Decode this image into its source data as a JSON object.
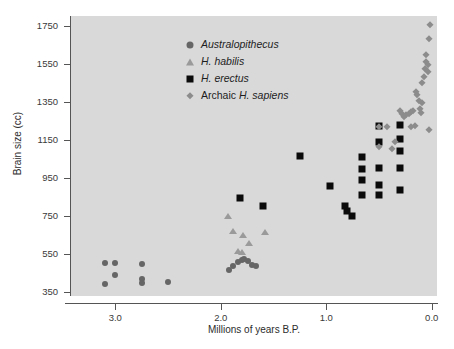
{
  "chart_data": {
    "type": "scatter",
    "title": "",
    "xlabel": "Millions of years B.P.",
    "ylabel": "Brain size (cc)",
    "xlim": [
      3.42,
      -0.05
    ],
    "ylim": [
      330,
      1800
    ],
    "x_reversed": true,
    "grid": false,
    "legend_position": "upper-left-inside",
    "xticks": [
      "3.0",
      "2.0",
      "1.0",
      "0.0"
    ],
    "xtick_values": [
      3.0,
      2.0,
      1.0,
      0.0
    ],
    "yticks": [
      "350",
      "550",
      "750",
      "950",
      "1150",
      "1350",
      "1550",
      "1750"
    ],
    "ytick_values": [
      350,
      550,
      750,
      950,
      1150,
      1350,
      1550,
      1750
    ],
    "plot_background": "#d9d9d9",
    "series": [
      {
        "name": "Australopithecus",
        "italic": true,
        "marker": "circle",
        "color": "#666666",
        "size": 6,
        "points": [
          [
            3.1,
            505
          ],
          [
            3.0,
            505
          ],
          [
            3.1,
            395
          ],
          [
            3.0,
            440
          ],
          [
            2.75,
            500
          ],
          [
            2.75,
            420
          ],
          [
            2.75,
            400
          ],
          [
            2.5,
            405
          ],
          [
            1.92,
            465
          ],
          [
            1.88,
            490
          ],
          [
            1.84,
            510
          ],
          [
            1.8,
            520
          ],
          [
            1.78,
            522
          ],
          [
            1.74,
            512
          ],
          [
            1.7,
            495
          ],
          [
            1.67,
            487
          ]
        ]
      },
      {
        "name": "H. habilis",
        "italic": true,
        "marker": "triangle",
        "color": "#9a9a9a",
        "size": 7,
        "points": [
          [
            1.93,
            750
          ],
          [
            1.88,
            670
          ],
          [
            1.84,
            565
          ],
          [
            1.8,
            560
          ],
          [
            1.79,
            650
          ],
          [
            1.73,
            610
          ],
          [
            1.58,
            665
          ]
        ]
      },
      {
        "name": "H. erectus",
        "italic": true,
        "marker": "square",
        "color": "#0a0a0a",
        "size": 7,
        "points": [
          [
            1.82,
            845
          ],
          [
            1.6,
            800
          ],
          [
            1.25,
            1065
          ],
          [
            0.96,
            910
          ],
          [
            0.82,
            805
          ],
          [
            0.8,
            775
          ],
          [
            0.76,
            750
          ],
          [
            0.66,
            1060
          ],
          [
            0.66,
            995
          ],
          [
            0.66,
            940
          ],
          [
            0.66,
            860
          ],
          [
            0.5,
            1220
          ],
          [
            0.5,
            1140
          ],
          [
            0.5,
            1000
          ],
          [
            0.5,
            915
          ],
          [
            0.5,
            860
          ],
          [
            0.3,
            1230
          ],
          [
            0.3,
            1155
          ],
          [
            0.3,
            1090
          ],
          [
            0.3,
            1000
          ],
          [
            0.3,
            885
          ]
        ]
      },
      {
        "name": "Archaic H. sapiens",
        "italic": false,
        "marker": "diamond",
        "color": "#8c8c8c",
        "size": 7,
        "points": [
          [
            0.5,
            1215
          ],
          [
            0.5,
            1110
          ],
          [
            0.42,
            1215
          ],
          [
            0.38,
            1100
          ],
          [
            0.35,
            1140
          ],
          [
            0.3,
            1300
          ],
          [
            0.28,
            1285
          ],
          [
            0.26,
            1270
          ],
          [
            0.24,
            1280
          ],
          [
            0.22,
            1285
          ],
          [
            0.2,
            1295
          ],
          [
            0.18,
            1300
          ],
          [
            0.16,
            1225
          ],
          [
            0.15,
            1400
          ],
          [
            0.14,
            1385
          ],
          [
            0.12,
            1355
          ],
          [
            0.11,
            1310
          ],
          [
            0.1,
            1290
          ],
          [
            0.09,
            1450
          ],
          [
            0.07,
            1480
          ],
          [
            0.06,
            1520
          ],
          [
            0.05,
            1560
          ],
          [
            0.05,
            1595
          ],
          [
            0.04,
            1545
          ],
          [
            0.04,
            1505
          ],
          [
            0.03,
            1680
          ],
          [
            0.02,
            1755
          ],
          [
            0.03,
            1200
          ],
          [
            0.2,
            1215
          ],
          [
            0.09,
            1345
          ]
        ]
      }
    ]
  },
  "legend": {
    "items": [
      {
        "label": "Australopithecus",
        "marker": "circle",
        "color": "#666666",
        "italic": true
      },
      {
        "label": "H. habilis",
        "marker": "triangle",
        "color": "#9a9a9a",
        "italic": true
      },
      {
        "label": "H. erectus",
        "marker": "square",
        "color": "#0a0a0a",
        "italic": true
      },
      {
        "label": "Archaic H. sapiens",
        "marker": "diamond",
        "color": "#8c8c8c",
        "italic": false,
        "roman_prefix": "Archaic "
      }
    ]
  }
}
